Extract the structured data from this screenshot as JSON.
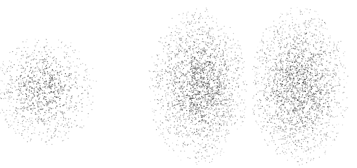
{
  "figure": {
    "title": "",
    "background_color": "#ffffff",
    "width": 357,
    "height": 168,
    "point_color": "#6e6e6e",
    "point_color_dark": "#3c3c3c",
    "point_color_light": "#b4b4b4",
    "marker": "square-dot",
    "marker_size_px": 1.15
  },
  "chart_data": {
    "type": "scatter",
    "title": "",
    "subtitle": "",
    "xlabel": "",
    "ylabel": "",
    "grid": false,
    "legend": null,
    "axes_visible": false,
    "tick_labels_x": [],
    "tick_labels_y": [],
    "xlim": [
      0,
      357
    ],
    "ylim": [
      0,
      168
    ],
    "clusters": [
      {
        "name": "left-cluster",
        "shape": "circular-gaussian",
        "center_x": 45,
        "center_y": 90,
        "sigma_x": 26,
        "sigma_y": 27,
        "radius_x": 52,
        "radius_y": 55,
        "n_points": 1100,
        "core_density": "high",
        "core_offset_x": -6,
        "core_offset_y": 2,
        "clipped_edges": [
          "left"
        ],
        "bounds": [
          0,
          33,
          100,
          152
        ]
      },
      {
        "name": "center-cluster",
        "shape": "vertical-ellipse-gaussian",
        "center_x": 198,
        "center_y": 86,
        "sigma_x": 25,
        "sigma_y": 39,
        "radius_x": 51,
        "radius_y": 79,
        "n_points": 2200,
        "core_density": "high",
        "core_offset_x": 8,
        "core_offset_y": 0,
        "clipped_edges": [],
        "bounds": [
          147,
          7,
          249,
          166
        ]
      },
      {
        "name": "right-cluster",
        "shape": "vertical-ellipse-gaussian",
        "center_x": 300,
        "center_y": 86,
        "sigma_x": 25,
        "sigma_y": 39,
        "radius_x": 50,
        "radius_y": 79,
        "n_points": 2200,
        "core_density": "high",
        "core_offset_x": -6,
        "core_offset_y": 0,
        "clipped_edges": [],
        "bounds": [
          250,
          7,
          351,
          166
        ]
      }
    ],
    "gaps": [
      {
        "name": "center-right-gap",
        "orientation": "vertical",
        "x_start": 247,
        "x_end": 252
      }
    ],
    "series": [
      {
        "name": "left-cluster",
        "values": 1100
      },
      {
        "name": "center-cluster",
        "values": 2200
      },
      {
        "name": "right-cluster",
        "values": 2200
      }
    ]
  }
}
